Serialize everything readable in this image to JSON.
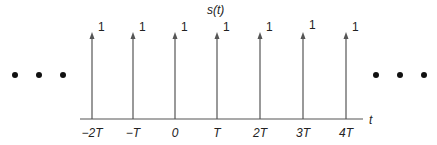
{
  "title": "s(t)",
  "axis_label": "t",
  "colors": {
    "stroke": "#555555",
    "text": "#222222",
    "dot": "#111111"
  },
  "impulses": [
    {
      "x": 92,
      "tick": "−2T",
      "weight": "1"
    },
    {
      "x": 133,
      "tick": "−T",
      "weight": "1"
    },
    {
      "x": 175,
      "tick": "0",
      "weight": "1"
    },
    {
      "x": 217,
      "tick": "T",
      "weight": "1"
    },
    {
      "x": 260,
      "tick": "2T",
      "weight": "1"
    },
    {
      "x": 303,
      "tick": "3T",
      "weight": "1"
    },
    {
      "x": 346,
      "tick": "4T",
      "weight": "1"
    }
  ],
  "ellipsis_left": [
    15,
    39,
    63
  ],
  "ellipsis_right": [
    376,
    400,
    424
  ],
  "chart_data": {
    "type": "stem",
    "title": "s(t)",
    "xlabel": "t",
    "ylabel": "",
    "categories": [
      "−2T",
      "−T",
      "0",
      "T",
      "2T",
      "3T",
      "4T"
    ],
    "values": [
      1,
      1,
      1,
      1,
      1,
      1,
      1
    ],
    "note": "Periodic impulse train with period T; each impulse has weight 1; ellipses indicate continuation in both directions",
    "grid": false
  }
}
